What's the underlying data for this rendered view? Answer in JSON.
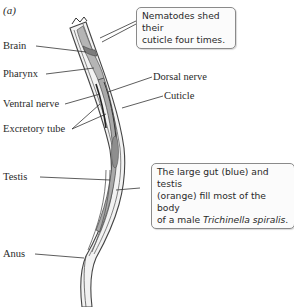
{
  "figure": {
    "panel_label": "(a)",
    "labels": {
      "brain": "Brain",
      "pharynx": "Pharynx",
      "ventral_nerve": "Ventral nerve",
      "excretory_tube": "Excretory tube",
      "testis": "Testis",
      "anus": "Anus",
      "dorsal_nerve": "Dorsal nerve",
      "cuticle": "Cuticle"
    },
    "callouts": {
      "top": {
        "line1": "Nematodes shed their",
        "line2": "cuticle four times."
      },
      "bottom": {
        "line1": "The large gut (blue) and testis",
        "line2": "(orange) fill most of the body",
        "line3_prefix": "of a male ",
        "line3_species": "Trichinella spiralis",
        "line3_suffix": "."
      }
    }
  }
}
